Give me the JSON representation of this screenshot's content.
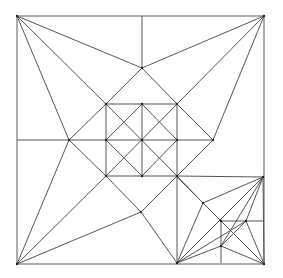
{
  "diagram": {
    "type": "crease-pattern",
    "colors": {
      "line": "#555555",
      "border": "#777777",
      "vertex": "#222222",
      "background": "#ffffff"
    },
    "square": {
      "x": 17,
      "y": 16,
      "size": 247
    },
    "vertices": [
      [
        17,
        16
      ],
      [
        264,
        16
      ],
      [
        17,
        264
      ],
      [
        264,
        264
      ],
      [
        142,
        68
      ],
      [
        69,
        140
      ],
      [
        213,
        140
      ],
      [
        177,
        263
      ],
      [
        263,
        177
      ],
      [
        106,
        104
      ],
      [
        142,
        104
      ],
      [
        177,
        104
      ],
      [
        106,
        140
      ],
      [
        142,
        140
      ],
      [
        177,
        140
      ],
      [
        106,
        176
      ],
      [
        142,
        176
      ],
      [
        177,
        176
      ],
      [
        141,
        212
      ],
      [
        203,
        203
      ],
      [
        221,
        221
      ],
      [
        246,
        221
      ],
      [
        221,
        246
      ]
    ],
    "lines": [
      [
        142,
        16,
        142,
        68
      ],
      [
        17,
        140,
        106,
        140
      ],
      [
        17,
        16,
        142,
        68
      ],
      [
        17,
        16,
        106,
        104
      ],
      [
        17,
        16,
        69,
        140
      ],
      [
        264,
        16,
        142,
        68
      ],
      [
        264,
        16,
        177,
        104
      ],
      [
        264,
        16,
        213,
        140
      ],
      [
        17,
        264,
        69,
        140
      ],
      [
        17,
        264,
        106,
        176
      ],
      [
        17,
        264,
        141,
        212
      ],
      [
        264,
        264,
        177,
        177
      ],
      [
        264,
        264,
        246,
        221
      ],
      [
        264,
        264,
        221,
        246
      ],
      [
        264,
        264,
        263,
        177
      ],
      [
        142,
        68,
        106,
        104
      ],
      [
        142,
        68,
        177,
        104
      ],
      [
        69,
        140,
        106,
        104
      ],
      [
        69,
        140,
        106,
        176
      ],
      [
        213,
        140,
        177,
        104
      ],
      [
        213,
        140,
        177,
        176
      ],
      [
        177,
        140,
        213,
        140
      ],
      [
        106,
        104,
        177,
        104
      ],
      [
        106,
        140,
        177,
        140
      ],
      [
        106,
        176,
        177,
        176
      ],
      [
        106,
        104,
        106,
        176
      ],
      [
        142,
        104,
        142,
        176
      ],
      [
        177,
        104,
        177,
        176
      ],
      [
        106,
        104,
        177,
        176
      ],
      [
        177,
        104,
        106,
        176
      ],
      [
        142,
        104,
        106,
        140
      ],
      [
        142,
        104,
        177,
        140
      ],
      [
        106,
        140,
        142,
        176
      ],
      [
        177,
        140,
        142,
        176
      ],
      [
        106,
        176,
        141,
        212
      ],
      [
        141,
        212,
        177,
        263
      ],
      [
        177,
        176,
        141,
        212
      ],
      [
        177,
        176,
        177,
        263
      ],
      [
        177,
        176,
        263,
        177
      ],
      [
        263,
        177,
        203,
        203
      ],
      [
        203,
        203,
        177,
        263
      ],
      [
        177,
        176,
        203,
        203
      ],
      [
        203,
        203,
        221,
        221
      ],
      [
        263,
        177,
        177,
        263
      ],
      [
        263,
        177,
        246,
        221
      ],
      [
        263,
        177,
        221,
        246
      ],
      [
        221,
        221,
        263,
        221
      ],
      [
        221,
        221,
        221,
        263
      ],
      [
        246,
        221,
        221,
        246
      ],
      [
        221,
        246,
        177,
        263
      ],
      [
        177,
        263,
        246,
        221
      ]
    ]
  }
}
